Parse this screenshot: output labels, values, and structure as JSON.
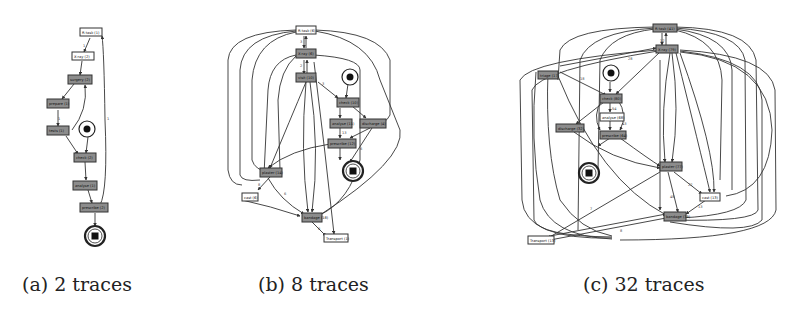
{
  "figure": {
    "panels": [
      {
        "id": "a",
        "caption": "(a) 2 traces",
        "nodes": [
          {
            "label": "R-task (1)",
            "fill": "#ffffff"
          },
          {
            "label": "X-ray (2)",
            "fill": "#ffffff"
          },
          {
            "label": "surgery (2)",
            "fill": "#8c8c8c"
          },
          {
            "label": "prepare (1)",
            "fill": "#8c8c8c"
          },
          {
            "label": "tests (1)",
            "fill": "#8c8c8c"
          },
          {
            "label": "check (2)",
            "fill": "#8c8c8c"
          },
          {
            "label": "analyse (1)",
            "fill": "#8c8c8c"
          },
          {
            "label": "prescribe (2)",
            "fill": "#8c8c8c"
          }
        ],
        "start_place": "start",
        "end_place": "end"
      },
      {
        "id": "b",
        "caption": "(b) 8 traces",
        "nodes": [
          {
            "label": "R-task (6)",
            "fill": "#ffffff"
          },
          {
            "label": "X-ray (6)",
            "fill": "#8c8c8c"
          },
          {
            "label": "visit (10)",
            "fill": "#8c8c8c"
          },
          {
            "label": "check (10)",
            "fill": "#8c8c8c"
          },
          {
            "label": "analyse (11)",
            "fill": "#8c8c8c"
          },
          {
            "label": "discharge (4)",
            "fill": "#8c8c8c"
          },
          {
            "label": "prescribe (12)",
            "fill": "#8c8c8c"
          },
          {
            "label": "plaster (14)",
            "fill": "#8c8c8c"
          },
          {
            "label": "cast (6)",
            "fill": "#ffffff"
          },
          {
            "label": "bandage (18)",
            "fill": "#8c8c8c"
          },
          {
            "label": "Transport (1)",
            "fill": "#ffffff"
          }
        ],
        "start_place": "start",
        "end_place": "end"
      },
      {
        "id": "c",
        "caption": "(c) 32 traces",
        "nodes": [
          {
            "label": "R-task (41)",
            "fill": "#8c8c8c"
          },
          {
            "label": "X-ray (79)",
            "fill": "#8c8c8c"
          },
          {
            "label": "triage (17)",
            "fill": "#8c8c8c"
          },
          {
            "label": "check (80)",
            "fill": "#8c8c8c"
          },
          {
            "label": "analyse (68)",
            "fill": "#ffffff"
          },
          {
            "label": "discharge (32)",
            "fill": "#8c8c8c"
          },
          {
            "label": "prescribe (64)",
            "fill": "#8c8c8c"
          },
          {
            "label": "plaster (77)",
            "fill": "#8c8c8c"
          },
          {
            "label": "cast (13)",
            "fill": "#ffffff"
          },
          {
            "label": "bandage (79)",
            "fill": "#8c8c8c"
          },
          {
            "label": "Transport (13)",
            "fill": "#ffffff"
          }
        ],
        "start_place": "start",
        "end_place": "end"
      }
    ]
  }
}
